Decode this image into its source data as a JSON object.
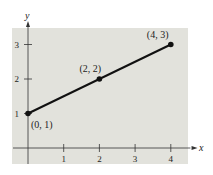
{
  "chart_data": {
    "type": "line",
    "title": "",
    "xlabel": "x",
    "ylabel": "y",
    "xlim": [
      -0.4,
      4.5
    ],
    "ylim": [
      -0.4,
      3.25
    ],
    "grid": false,
    "background_color": "#e2e2dc",
    "line_color": "#111111",
    "x_ticks": [
      1,
      2,
      3,
      4
    ],
    "x_tick_labels": [
      "1",
      "2",
      "3",
      "4"
    ],
    "y_ticks": [
      1,
      2,
      3
    ],
    "y_tick_labels": [
      "1",
      "2",
      "3"
    ],
    "series": [
      {
        "name": "segments",
        "points": [
          {
            "x": 0,
            "y": 1,
            "label": "(0, 1)"
          },
          {
            "x": 2,
            "y": 2,
            "label": "(2, 2)"
          },
          {
            "x": 4,
            "y": 3,
            "label": "(4, 3)"
          }
        ]
      }
    ]
  }
}
